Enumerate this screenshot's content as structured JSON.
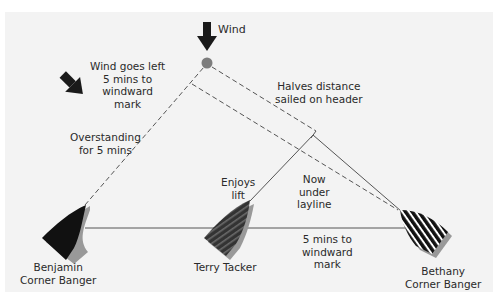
{
  "diagram": {
    "type": "sailing-tactics",
    "background_color": "#f3f3f3",
    "wind": {
      "label": "Wind",
      "direction": "down",
      "icon": "arrow-down-icon"
    },
    "shifted_wind": {
      "label_lines": [
        "Wind goes left",
        "5 mins to",
        "windward",
        "mark"
      ],
      "direction": "down-right",
      "icon": "arrow-diagonal-icon"
    },
    "mark": {
      "color": "#7d7d7d",
      "icon": "windward-mark-icon"
    },
    "annotations": {
      "overstanding": [
        "Overstanding",
        "for 5 mins"
      ],
      "halves_distance": [
        "Halves distance",
        "sailed on header"
      ],
      "enjoys_lift": [
        "Enjoys",
        "lift"
      ],
      "under_layline": [
        "Now",
        "under",
        "layline"
      ],
      "five_mins": [
        "5 mins to",
        "windward",
        "mark"
      ]
    },
    "boats": [
      {
        "name_lines": [
          "Benjamin",
          "Corner Banger"
        ],
        "fill": "#111111",
        "pattern": "solid"
      },
      {
        "name_lines": [
          "Terry Tacker"
        ],
        "fill": "#3a3a3a",
        "pattern": "dark-stripes"
      },
      {
        "name_lines": [
          "Bethany",
          "Corner Banger"
        ],
        "fill": "#111111",
        "pattern": "white-stripes"
      }
    ],
    "colors": {
      "line": "#555555",
      "arrow": "#1a1a1a",
      "text": "#2a2a2a"
    }
  }
}
